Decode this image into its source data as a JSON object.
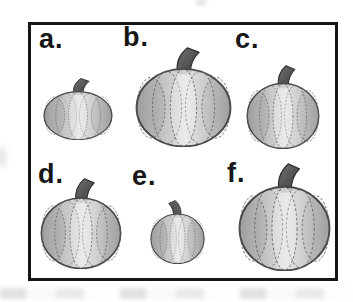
{
  "figure": {
    "type": "pumpkin-size-comparison-illustration",
    "frame_border_color": "#161616",
    "label_color": "#161616",
    "items": [
      {
        "label": "a.",
        "relative_size": "small",
        "approx_px": {
          "w": 70,
          "h": 48
        },
        "stem_tilt": "right"
      },
      {
        "label": "b.",
        "relative_size": "largest",
        "approx_px": {
          "w": 97,
          "h": 88
        },
        "stem_tilt": "right"
      },
      {
        "label": "c.",
        "relative_size": "medium",
        "approx_px": {
          "w": 74,
          "h": 73
        },
        "stem_tilt": "right"
      },
      {
        "label": "d.",
        "relative_size": "medium-large",
        "approx_px": {
          "w": 82,
          "h": 75
        },
        "stem_tilt": "right"
      },
      {
        "label": "e.",
        "relative_size": "smallest",
        "approx_px": {
          "w": 55,
          "h": 53
        },
        "stem_tilt": "left"
      },
      {
        "label": "f.",
        "relative_size": "large",
        "approx_px": {
          "w": 93,
          "h": 92
        },
        "stem_tilt": "right"
      }
    ],
    "colors": {
      "body_dark": "#a7a7a7",
      "body_mid": "#c9c9c9",
      "body_light": "#e2e2e2",
      "outline": "#4a4a4a",
      "rib": "#5c5c5c",
      "stem_light": "#707070",
      "stem_dark": "#3e3e3e",
      "stem_outline": "#2f2f2f"
    }
  }
}
